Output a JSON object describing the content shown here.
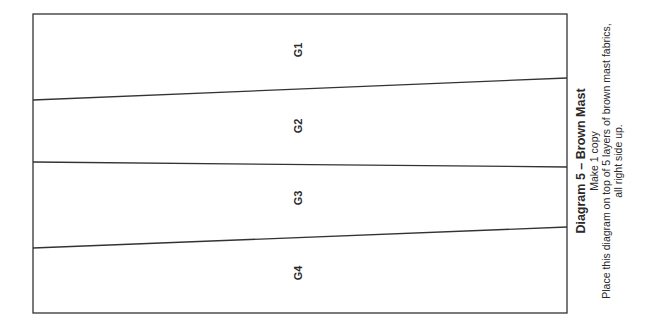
{
  "diagram": {
    "colors": {
      "stroke": "#333333",
      "text": "#2a2a2a",
      "background": "#ffffff"
    },
    "sections": [
      {
        "label": "G1"
      },
      {
        "label": "G2"
      },
      {
        "label": "G3"
      },
      {
        "label": "G4"
      }
    ],
    "caption": {
      "title": "Diagram 5 – Brown Mast",
      "line1": "Make 1 copy",
      "line2": "Place this diagram on top of 5 layers of brown mast fabrics,",
      "line3": "all right side up."
    }
  }
}
